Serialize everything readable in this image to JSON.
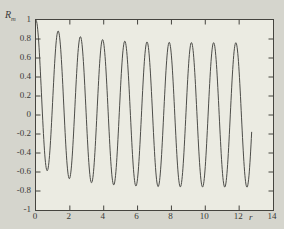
{
  "figure": {
    "background": "#d5d5cd",
    "plot_background": "#ebebe2",
    "ink_color": "#45443f",
    "curve_color": "#4c4c48"
  },
  "chart_data": {
    "type": "line",
    "title": "",
    "xlabel": "r",
    "ylabel": "R",
    "ylabel_subscript": "m",
    "xlim": [
      0,
      14
    ],
    "ylim": [
      -1,
      1
    ],
    "grid": false,
    "legend": false,
    "x_tick_values": [
      0,
      2,
      4,
      6,
      8,
      10,
      12,
      14
    ],
    "x_tick_labels": [
      "0",
      "2",
      "4",
      "6",
      "8",
      "10",
      "12",
      "14"
    ],
    "y_tick_values": [
      1,
      0.8,
      0.6,
      0.4,
      0.2,
      0,
      -0.2,
      -0.4,
      -0.6,
      -0.8,
      -1
    ],
    "y_tick_labels": [
      "1",
      "0.8",
      "0.6",
      "0.4",
      "0.2",
      "0",
      "-0.2",
      "-0.4",
      "-0.6",
      "-0.8",
      "-1"
    ],
    "series": [
      {
        "name": "Rm(r)",
        "model": "R(r) = a*exp(-alpha*r) + b*cos(k*r)",
        "params": {
          "a": 0.24,
          "alpha": 0.5,
          "b": 0.76,
          "k": 4.79
        },
        "r_start": 0,
        "r_end": 12.74,
        "sample_step": 0.02,
        "key_points": {
          "start": [
            0,
            1.0
          ],
          "peaks": [
            [
              1.31,
              0.89
            ],
            [
              2.62,
              0.83
            ],
            [
              3.94,
              0.8
            ],
            [
              5.25,
              0.79
            ],
            [
              6.56,
              0.78
            ],
            [
              7.87,
              0.78
            ],
            [
              9.18,
              0.77
            ],
            [
              10.49,
              0.77
            ],
            [
              11.81,
              0.77
            ]
          ],
          "troughs": [
            [
              0.66,
              -0.59
            ],
            [
              1.97,
              -0.68
            ],
            [
              3.28,
              -0.72
            ],
            [
              4.59,
              -0.74
            ],
            [
              5.9,
              -0.75
            ],
            [
              7.21,
              -0.75
            ],
            [
              8.52,
              -0.76
            ],
            [
              9.84,
              -0.76
            ],
            [
              11.15,
              -0.76
            ],
            [
              12.46,
              -0.76
            ]
          ],
          "end": [
            12.74,
            -0.24
          ]
        }
      }
    ]
  }
}
